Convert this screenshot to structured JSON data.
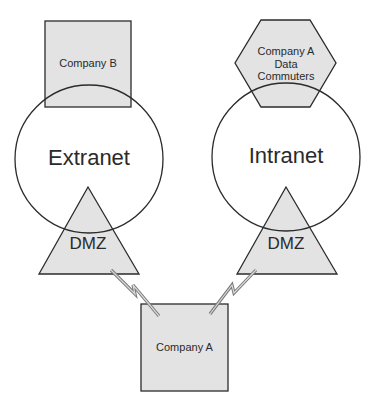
{
  "diagram": {
    "nodes": {
      "company_b": {
        "label": "Company B",
        "shape": "square"
      },
      "company_a_data_commuters": {
        "label_lines": [
          "Company A",
          "Data",
          "Commuters"
        ],
        "shape": "hexagon"
      },
      "extranet": {
        "label": "Extranet",
        "shape": "circle"
      },
      "intranet": {
        "label": "Intranet",
        "shape": "circle"
      },
      "dmz_left": {
        "label": "DMZ",
        "shape": "triangle"
      },
      "dmz_right": {
        "label": "DMZ",
        "shape": "triangle"
      },
      "company_a": {
        "label": "Company A",
        "shape": "square"
      }
    },
    "edges": [
      {
        "from": "company_a",
        "to": "dmz_left",
        "style": "lightning-bolt"
      },
      {
        "from": "company_a",
        "to": "dmz_right",
        "style": "lightning-bolt"
      }
    ],
    "colors": {
      "fill": "#e3e3e3",
      "stroke": "#2b2b2b",
      "link": "#8a8a8a",
      "text": "#2a2a2a"
    }
  }
}
